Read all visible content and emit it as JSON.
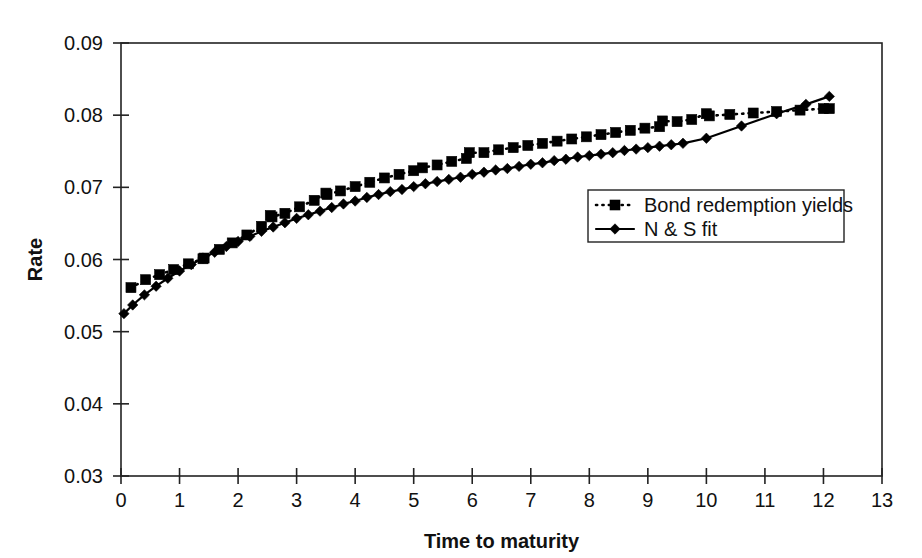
{
  "chart_data": {
    "type": "line",
    "title": "",
    "xlabel": "Time to maturity",
    "ylabel": "Rate",
    "xlim": [
      0,
      13
    ],
    "ylim": [
      0.03,
      0.09
    ],
    "xticks": [
      "0",
      "1",
      "2",
      "3",
      "4",
      "5",
      "6",
      "7",
      "8",
      "9",
      "10",
      "11",
      "12",
      "13"
    ],
    "xtick_values": [
      0,
      1,
      2,
      3,
      4,
      5,
      6,
      7,
      8,
      9,
      10,
      11,
      12,
      13
    ],
    "yticks": [
      "0.03",
      "0.04",
      "0.05",
      "0.06",
      "0.07",
      "0.08",
      "0.09"
    ],
    "ytick_values": [
      0.03,
      0.04,
      0.05,
      0.06,
      0.07,
      0.08,
      0.09
    ],
    "grid": false,
    "legend_position": "center-right",
    "series": [
      {
        "name": "Bond redemption yields",
        "style": "dotted",
        "marker": "square",
        "color": "#000000",
        "x": [
          0.17,
          0.42,
          0.66,
          0.9,
          1.15,
          1.4,
          1.42,
          1.68,
          1.9,
          2.15,
          2.4,
          2.55,
          2.58,
          2.8,
          3.05,
          3.3,
          3.5,
          3.52,
          3.75,
          4.0,
          4.25,
          4.5,
          4.75,
          5.0,
          5.15,
          5.4,
          5.65,
          5.9,
          5.95,
          6.2,
          6.45,
          6.7,
          6.95,
          7.2,
          7.45,
          7.7,
          7.95,
          8.2,
          8.45,
          8.7,
          8.95,
          9.2,
          9.25,
          9.5,
          9.75,
          10.0,
          10.05,
          10.4,
          10.8,
          11.2,
          11.6,
          12.0,
          12.1
        ],
        "y": [
          0.0561,
          0.0572,
          0.0579,
          0.0586,
          0.0594,
          0.0601,
          0.0602,
          0.0614,
          0.0623,
          0.0634,
          0.0646,
          0.0661,
          0.0659,
          0.0664,
          0.0673,
          0.0682,
          0.0692,
          0.069,
          0.0695,
          0.0701,
          0.0707,
          0.0713,
          0.0718,
          0.0723,
          0.0727,
          0.0731,
          0.0736,
          0.074,
          0.0748,
          0.0748,
          0.0752,
          0.0755,
          0.0758,
          0.0761,
          0.0764,
          0.0767,
          0.077,
          0.0773,
          0.0776,
          0.0779,
          0.0782,
          0.0784,
          0.0792,
          0.0791,
          0.0794,
          0.0802,
          0.0799,
          0.0801,
          0.0803,
          0.0805,
          0.0807,
          0.0809,
          0.0809
        ]
      },
      {
        "name": "N & S fit",
        "style": "solid",
        "marker": "diamond",
        "color": "#000000",
        "x": [
          0.05,
          0.2,
          0.4,
          0.6,
          0.8,
          1.0,
          1.2,
          1.4,
          1.6,
          1.8,
          2.0,
          2.2,
          2.4,
          2.6,
          2.8,
          3.0,
          3.2,
          3.4,
          3.6,
          3.8,
          4.0,
          4.2,
          4.4,
          4.6,
          4.8,
          5.0,
          5.2,
          5.4,
          5.6,
          5.8,
          6.0,
          6.2,
          6.4,
          6.6,
          6.8,
          7.0,
          7.2,
          7.4,
          7.6,
          7.8,
          8.0,
          8.2,
          8.4,
          8.6,
          8.8,
          9.0,
          9.2,
          9.4,
          9.6,
          10.0,
          10.6,
          11.2,
          11.7,
          12.1
        ],
        "y": [
          0.0525,
          0.0537,
          0.0551,
          0.0563,
          0.0574,
          0.0584,
          0.0593,
          0.0602,
          0.061,
          0.0618,
          0.0625,
          0.0632,
          0.0639,
          0.0645,
          0.0651,
          0.0657,
          0.0662,
          0.0667,
          0.0672,
          0.0677,
          0.0681,
          0.0686,
          0.069,
          0.0694,
          0.0697,
          0.0701,
          0.0705,
          0.0708,
          0.0711,
          0.0714,
          0.0718,
          0.0721,
          0.0724,
          0.0726,
          0.0729,
          0.0732,
          0.0734,
          0.0737,
          0.0739,
          0.0742,
          0.0744,
          0.0746,
          0.0748,
          0.0751,
          0.0753,
          0.0755,
          0.0757,
          0.0759,
          0.0761,
          0.0768,
          0.0785,
          0.0802,
          0.0815,
          0.0826
        ]
      }
    ],
    "legend": [
      {
        "label": "Bond redemption yields",
        "style": "dotted",
        "marker": "square"
      },
      {
        "label": "N & S fit",
        "style": "solid",
        "marker": "diamond"
      }
    ]
  },
  "layout": {
    "plot_left": 121,
    "plot_right": 882,
    "plot_top": 43,
    "plot_bottom": 476,
    "legend_x": 588,
    "legend_y": 190,
    "legend_w": 256,
    "legend_h": 52
  }
}
